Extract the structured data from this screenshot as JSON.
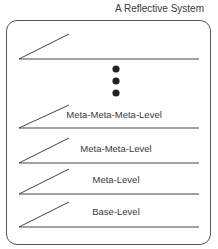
{
  "diagram": {
    "title": "A Reflective System",
    "levels": [
      {
        "label": "",
        "line_y": 59
      },
      {
        "label": "Meta-Meta-Meta-Level",
        "line_y": 128
      },
      {
        "label": "Meta-Meta-Level",
        "line_y": 163
      },
      {
        "label": "Meta-Level",
        "line_y": 194
      },
      {
        "label": "Base-Level",
        "line_y": 227
      }
    ],
    "ellipsis": "vertical-dots",
    "colors": {
      "stroke": "#444444",
      "dots": "#222222",
      "text": "#3a3a3a"
    }
  }
}
